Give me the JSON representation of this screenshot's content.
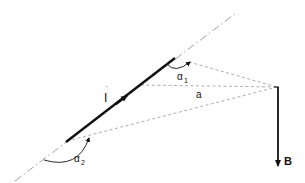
{
  "diagram": {
    "labels": {
      "current": "I",
      "angle1": "α",
      "angle1_sub": "1",
      "distance": "a",
      "angle2": "α",
      "angle2_sub": "2",
      "field": "B"
    },
    "colors": {
      "ink": "#111111",
      "dashed": "#9a9a9a",
      "axis": "#8a8a8a",
      "background": "#ffffff"
    },
    "elements": [
      "dash-dot axis line",
      "thick current segment with arrow",
      "dashed lines to field point",
      "angle arcs alpha1 and alpha2",
      "downward field vector B"
    ]
  }
}
